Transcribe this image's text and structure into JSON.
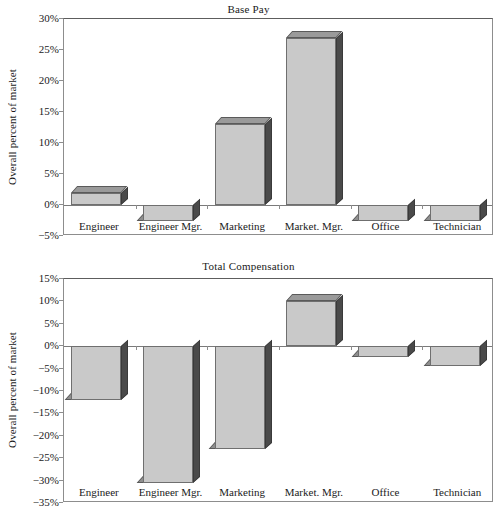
{
  "figure": {
    "categories": [
      "Engineer",
      "Engineer Mgr.",
      "Marketing",
      "Market. Mgr.",
      "Office",
      "Technician"
    ],
    "axis_title": "Overall percent of market",
    "bar_fill_color": "#c9c9c9",
    "bar_side_color": "#4a4a4a",
    "bar_top_color": "#9a9a9a"
  },
  "chart_data": [
    {
      "type": "bar",
      "title": "Base Pay",
      "xlabel": "",
      "ylabel": "Overall percent of market",
      "categories": [
        "Engineer",
        "Engineer Mgr.",
        "Marketing",
        "Market. Mgr.",
        "Office",
        "Technician"
      ],
      "values": [
        2,
        -2.5,
        13,
        27,
        -2.5,
        -2.5
      ],
      "ylim": [
        -5,
        30
      ],
      "ytick_values": [
        30,
        25,
        20,
        15,
        10,
        5,
        0,
        -5
      ],
      "ytick_labels": [
        "30%",
        "25%",
        "20%",
        "15%",
        "10%",
        "5%",
        "0%",
        "−5%"
      ],
      "grid": false,
      "legend": "none"
    },
    {
      "type": "bar",
      "title": "Total Compensation",
      "xlabel": "",
      "ylabel": "Overall percent of market",
      "categories": [
        "Engineer",
        "Engineer Mgr.",
        "Marketing",
        "Market. Mgr.",
        "Office",
        "Technician"
      ],
      "values": [
        -12,
        -30.5,
        -23,
        10,
        -2.5,
        -4.5
      ],
      "ylim": [
        -35,
        15
      ],
      "ytick_values": [
        15,
        10,
        5,
        0,
        -5,
        -10,
        -15,
        -20,
        -25,
        -30,
        -35
      ],
      "ytick_labels": [
        "15%",
        "10%",
        "5%",
        "0%",
        "−5%",
        "−10%",
        "−15%",
        "−20%",
        "−25%",
        "−30%",
        "−35%"
      ],
      "grid": false,
      "legend": "none"
    }
  ]
}
